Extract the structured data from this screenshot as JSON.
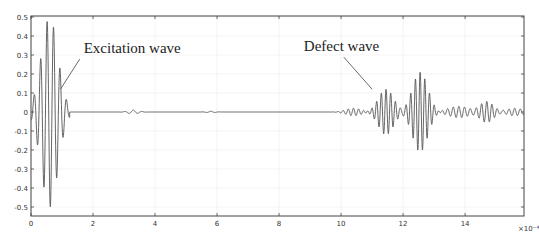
{
  "chart_data": {
    "type": "line",
    "title": "",
    "xlabel": "",
    "ylabel": "",
    "x_exponent_label": "×10⁻⁴",
    "xlim": [
      0,
      15.9
    ],
    "ylim": [
      -0.55,
      0.52
    ],
    "grid": true,
    "legend": null,
    "x_ticks": [
      0,
      2,
      4,
      6,
      8,
      10,
      12,
      14
    ],
    "x_tick_labels": [
      "0",
      "2",
      "4",
      "6",
      "8",
      "10",
      "12",
      "14"
    ],
    "y_ticks": [
      0.5,
      0.4,
      0.3,
      0.2,
      0.1,
      0,
      -0.1,
      -0.2,
      -0.3,
      -0.4,
      -0.5
    ],
    "y_tick_labels": [
      "0.5",
      "0.4",
      "0.3",
      "0.2",
      "0.1",
      "0",
      "-0.1",
      "-0.2",
      "-0.3",
      "-0.4",
      "-0.5"
    ],
    "annotations": [
      {
        "text": "Excitation wave",
        "x": 1.7,
        "y": 0.31,
        "arrow_to": [
          0.95,
          0.12
        ]
      },
      {
        "text": "Defect wave",
        "x": 8.8,
        "y": 0.32,
        "arrow_to": [
          11.0,
          0.12
        ]
      }
    ],
    "series": [
      {
        "name": "signal",
        "color": "#555555",
        "peaks": [
          {
            "x": 0.1,
            "y": 0.09
          },
          {
            "x": 0.27,
            "y": -0.22
          },
          {
            "x": 0.37,
            "y": 0.35
          },
          {
            "x": 0.5,
            "y": -0.44
          },
          {
            "x": 0.59,
            "y": 0.48
          },
          {
            "x": 0.71,
            "y": -0.49
          },
          {
            "x": 0.8,
            "y": 0.43
          },
          {
            "x": 0.92,
            "y": -0.35
          },
          {
            "x": 1.0,
            "y": 0.22
          },
          {
            "x": 1.12,
            "y": -0.09
          },
          {
            "x": 1.2,
            "y": 0.0
          },
          {
            "x": 11.1,
            "y": 0.11
          },
          {
            "x": 11.3,
            "y": -0.1
          },
          {
            "x": 11.45,
            "y": 0.12
          },
          {
            "x": 11.6,
            "y": -0.1
          },
          {
            "x": 11.75,
            "y": 0.1
          },
          {
            "x": 12.3,
            "y": 0.19
          },
          {
            "x": 12.45,
            "y": -0.19
          },
          {
            "x": 12.6,
            "y": 0.21
          },
          {
            "x": 12.75,
            "y": -0.19
          },
          {
            "x": 12.9,
            "y": 0.19
          },
          {
            "x": 14.6,
            "y": 0.05
          },
          {
            "x": 14.75,
            "y": -0.05
          }
        ],
        "segments": [
          {
            "label": "Excitation wave",
            "x_start": 0,
            "x_end": 1.2,
            "center": 0.6,
            "amplitude": 0.49,
            "cycles": 5
          },
          {
            "label": "quiet",
            "x_start": 1.2,
            "x_end": 10.0,
            "amplitude": 0.005
          },
          {
            "label": "small ripple",
            "x_start": 3.0,
            "x_end": 3.6,
            "amplitude": 0.01
          },
          {
            "label": "Defect wave",
            "x_start": 10.8,
            "x_end": 12.0,
            "center": 11.45,
            "amplitude": 0.12,
            "cycles": 3
          },
          {
            "label": "Defect wave 2",
            "x_start": 12.0,
            "x_end": 13.2,
            "center": 12.55,
            "amplitude": 0.21,
            "cycles": 4
          },
          {
            "label": "tail",
            "x_start": 13.2,
            "x_end": 15.9,
            "amplitude": 0.05
          }
        ]
      }
    ]
  }
}
